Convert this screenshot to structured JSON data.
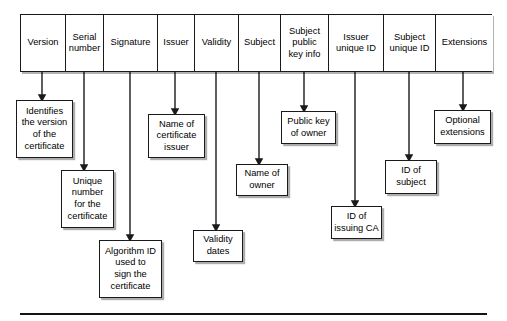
{
  "diagram": {
    "line_color": "#1a1a1a",
    "background_color": "#ffffff",
    "shadow_color": "#000000"
  },
  "fields": [
    {
      "id": "version",
      "label": "Version",
      "x": 20,
      "width": 45
    },
    {
      "id": "serial-number",
      "label": "Serial\nnumber",
      "x": 65,
      "width": 38
    },
    {
      "id": "signature",
      "label": "Signature",
      "x": 103,
      "width": 54
    },
    {
      "id": "issuer",
      "label": "Issuer",
      "x": 157,
      "width": 37
    },
    {
      "id": "validity",
      "label": "Validity",
      "x": 194,
      "width": 44
    },
    {
      "id": "subject",
      "label": "Subject",
      "x": 238,
      "width": 42
    },
    {
      "id": "subject-public-key-info",
      "label": "Subject\npublic\nkey info",
      "x": 280,
      "width": 48
    },
    {
      "id": "issuer-unique-id",
      "label": "Issuer\nunique ID",
      "x": 328,
      "width": 55
    },
    {
      "id": "subject-unique-id",
      "label": "Subject\nunique ID",
      "x": 383,
      "width": 52
    },
    {
      "id": "extensions",
      "label": "Extensions",
      "x": 435,
      "width": 57
    }
  ],
  "notes": [
    {
      "id": "identifies-version",
      "text": "Identifies\nthe version\nof the\ncertificate",
      "x": 16,
      "y": 100,
      "width": 57,
      "height": 58
    },
    {
      "id": "unique-number",
      "text": "Unique\nnumber\nfor the\ncertificate",
      "x": 61,
      "y": 170,
      "width": 53,
      "height": 58
    },
    {
      "id": "algorithm-id",
      "text": "Algorithm ID\nused to\nsign the\ncertificate",
      "x": 99,
      "y": 240,
      "width": 63,
      "height": 58
    },
    {
      "id": "name-of-issuer",
      "text": "Name of\ncertificate\nissuer",
      "x": 148,
      "y": 114,
      "width": 57,
      "height": 44
    },
    {
      "id": "validity-dates",
      "text": "Validity\ndates",
      "x": 193,
      "y": 230,
      "width": 50,
      "height": 32
    },
    {
      "id": "name-of-owner",
      "text": "Name of\nowner",
      "x": 236,
      "y": 164,
      "width": 52,
      "height": 32
    },
    {
      "id": "public-key-of-owner",
      "text": "Public key\nof owner",
      "x": 281,
      "y": 111,
      "width": 55,
      "height": 33
    },
    {
      "id": "id-of-issuing-ca",
      "text": "ID of\nissuing CA",
      "x": 331,
      "y": 206,
      "width": 51,
      "height": 33
    },
    {
      "id": "id-of-subject",
      "text": "ID of\nsubject",
      "x": 385,
      "y": 160,
      "width": 52,
      "height": 34
    },
    {
      "id": "optional-extensions",
      "text": "Optional\nextensions",
      "x": 434,
      "y": 110,
      "width": 57,
      "height": 34
    }
  ],
  "connectors": [
    {
      "id": "version-connector",
      "x": 42,
      "y1": 72,
      "y2": 98
    },
    {
      "id": "serial-number-connector",
      "x": 84,
      "y1": 72,
      "y2": 168
    },
    {
      "id": "signature-connector",
      "x": 130,
      "y1": 72,
      "y2": 238
    },
    {
      "id": "issuer-connector",
      "x": 175,
      "y1": 72,
      "y2": 112
    },
    {
      "id": "validity-connector",
      "x": 216,
      "y1": 72,
      "y2": 228
    },
    {
      "id": "subject-connector",
      "x": 259,
      "y1": 72,
      "y2": 162
    },
    {
      "id": "subject-public-key-connector",
      "x": 304,
      "y1": 72,
      "y2": 109
    },
    {
      "id": "issuer-unique-id-connector",
      "x": 355,
      "y1": 72,
      "y2": 204
    },
    {
      "id": "subject-unique-id-connector",
      "x": 409,
      "y1": 72,
      "y2": 158
    },
    {
      "id": "extensions-connector",
      "x": 463,
      "y1": 72,
      "y2": 108
    }
  ]
}
